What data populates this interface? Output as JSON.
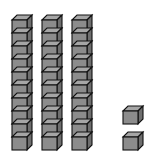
{
  "diagram": {
    "type": "base-ten-blocks",
    "value": 32,
    "tens_rods": 3,
    "ones_cubes": 2,
    "cubes_per_rod": 10,
    "colors": {
      "front": "#8c8c8c",
      "top": "#a6a6a6",
      "side": "#6e6e6e",
      "stroke": "#111111",
      "background": "#ffffff"
    }
  }
}
